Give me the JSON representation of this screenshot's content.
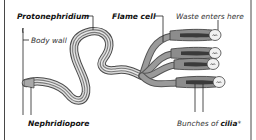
{
  "diagram": {
    "labels": {
      "protonephridium": "Protonephridium",
      "flame_cell": "Flame cell",
      "waste_enters": "Waste enters here",
      "body_wall": "Body wall",
      "nephridiopore": "Nephridiopore",
      "cilia_prefix": "Bunches of ",
      "cilia_bold": "cilia",
      "cilia_suffix": "*"
    },
    "colors": {
      "tube_outline": "#4a4a4a",
      "tube_fill": "#d9d9d9",
      "tube_core": "#7a7a7a",
      "flame_cell_body": "#8c8c8c",
      "flame_cell_cap": "#f1f1f1",
      "text": "#111111",
      "background": "#ffffff"
    },
    "flame_cells_count": 4
  }
}
